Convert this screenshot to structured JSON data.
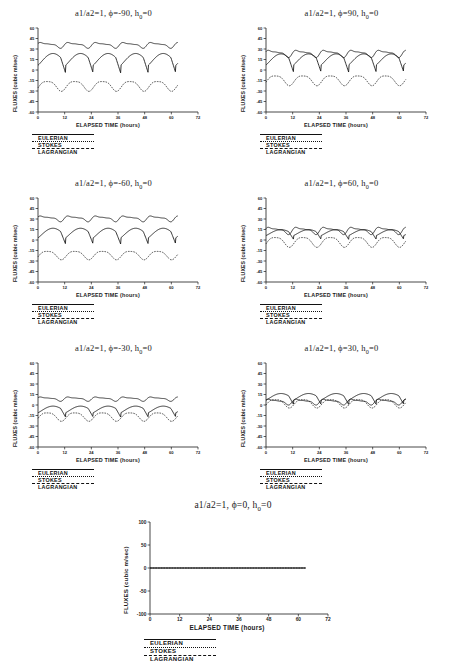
{
  "figure": {
    "axis_label_x": "ELAPSED TIME (hours)",
    "axis_label_y": "FLUXES (cubic m/sec)",
    "legend": [
      {
        "name": "EULERIAN",
        "style": "solid"
      },
      {
        "name": "STOKES",
        "style": "dotted"
      },
      {
        "name": "LAGRANGIAN",
        "style": "dashed"
      }
    ]
  },
  "chart_data": [
    {
      "type": "line",
      "title": "a1/a2=1, φ=-90, h₀=0",
      "title_parts": {
        "prefix": "a1/a2=1, ϕ=-90, h",
        "sub": "0",
        "suffix": "=0"
      },
      "xlabel": "ELAPSED TIME (hours)",
      "ylabel": "FLUXES (cubic m/sec)",
      "xlim": [
        0,
        72
      ],
      "ylim": [
        -60,
        60
      ],
      "xticks": [
        0,
        12,
        24,
        36,
        48,
        60,
        72
      ],
      "yticks": [
        60,
        45,
        30,
        15,
        0,
        -15,
        -30,
        -45,
        -60
      ],
      "grid": false,
      "series": [
        {
          "name": "STOKES",
          "style": "dotted",
          "mean": 36,
          "amp": 4,
          "shape": "wiggle",
          "period": 12.4
        },
        {
          "name": "EULERIAN",
          "style": "solid",
          "mean": 14,
          "amp": 16,
          "shape": "sawtooth",
          "period": 12.4
        },
        {
          "name": "LAGRANGIAN",
          "style": "dashed",
          "mean": -22,
          "amp": 7,
          "shape": "wave",
          "period": 12.4
        }
      ]
    },
    {
      "type": "line",
      "title": "a1/a2=1, φ=90, h₀=0",
      "title_parts": {
        "prefix": "a1/a2=1, ϕ=90, h",
        "sub": "0",
        "suffix": "=0"
      },
      "xlabel": "ELAPSED TIME (hours)",
      "ylabel": "FLUXES (cubic m/sec)",
      "xlim": [
        0,
        72
      ],
      "ylim": [
        -60,
        60
      ],
      "xticks": [
        0,
        12,
        24,
        36,
        48,
        60,
        72
      ],
      "yticks": [
        60,
        45,
        30,
        15,
        0,
        -15,
        -30,
        -45,
        -60
      ],
      "grid": false,
      "series": [
        {
          "name": "STOKES",
          "style": "dotted",
          "mean": 24,
          "amp": 5,
          "shape": "wiggle",
          "period": 12.4
        },
        {
          "name": "EULERIAN",
          "style": "solid",
          "mean": 14,
          "amp": 15,
          "shape": "sawtooth",
          "period": 12.4
        },
        {
          "name": "LAGRANGIAN",
          "style": "dashed",
          "mean": -14,
          "amp": 7,
          "shape": "wave",
          "period": 12.4
        }
      ]
    },
    {
      "type": "line",
      "title": "a1/a2=1, φ=-60, h₀=0",
      "title_parts": {
        "prefix": "a1/a2=1, ϕ=-60, h",
        "sub": "0",
        "suffix": "=0"
      },
      "xlabel": "ELAPSED TIME (hours)",
      "ylabel": "FLUXES (cubic m/sec)",
      "xlim": [
        0,
        72
      ],
      "ylim": [
        -60,
        60
      ],
      "xticks": [
        0,
        12,
        24,
        36,
        48,
        60,
        72
      ],
      "yticks": [
        60,
        45,
        30,
        15,
        0,
        -15,
        -30,
        -45,
        -60
      ],
      "grid": false,
      "series": [
        {
          "name": "STOKES",
          "style": "dotted",
          "mean": 31,
          "amp": 4,
          "shape": "wiggle",
          "period": 12.4
        },
        {
          "name": "EULERIAN",
          "style": "solid",
          "mean": 9,
          "amp": 13,
          "shape": "sawtooth",
          "period": 12.4
        },
        {
          "name": "LAGRANGIAN",
          "style": "dashed",
          "mean": -21,
          "amp": 6,
          "shape": "wave",
          "period": 12.4
        }
      ]
    },
    {
      "type": "line",
      "title": "a1/a2=1, φ=60, h₀=0",
      "title_parts": {
        "prefix": "a1/a2=1, ϕ=60, h",
        "sub": "0",
        "suffix": "=0"
      },
      "xlabel": "ELAPSED TIME (hours)",
      "ylabel": "FLUXES (cubic m/sec)",
      "xlim": [
        0,
        72
      ],
      "ylim": [
        -60,
        60
      ],
      "xticks": [
        0,
        12,
        24,
        36,
        48,
        60,
        72
      ],
      "yticks": [
        60,
        45,
        30,
        15,
        0,
        -15,
        -30,
        -45,
        -60
      ],
      "grid": false,
      "series": [
        {
          "name": "STOKES",
          "style": "dotted",
          "mean": 14,
          "amp": 5,
          "shape": "wiggle",
          "period": 12.4
        },
        {
          "name": "EULERIAN",
          "style": "solid",
          "mean": 10,
          "amp": 8,
          "shape": "sawtooth",
          "period": 12.4
        },
        {
          "name": "LAGRANGIAN",
          "style": "dashed",
          "mean": -2,
          "amp": 7,
          "shape": "wave",
          "period": 12.4
        }
      ]
    },
    {
      "type": "line",
      "title": "a1/a2=1, φ=-30, h₀=0",
      "title_parts": {
        "prefix": "a1/a2=1, ϕ=-30, h",
        "sub": "0",
        "suffix": "=0"
      },
      "xlabel": "ELAPSED TIME (hours)",
      "ylabel": "FLUXES (cubic m/sec)",
      "xlim": [
        0,
        72
      ],
      "ylim": [
        -60,
        60
      ],
      "xticks": [
        0,
        12,
        24,
        36,
        48,
        60,
        72
      ],
      "yticks": [
        60,
        45,
        30,
        15,
        0,
        -15,
        -30,
        -45,
        -60
      ],
      "grid": false,
      "series": [
        {
          "name": "STOKES",
          "style": "dotted",
          "mean": 9,
          "amp": 3,
          "shape": "wiggle",
          "period": 12.4
        },
        {
          "name": "EULERIAN",
          "style": "solid",
          "mean": -7,
          "amp": 9,
          "shape": "sawtooth",
          "period": 12.4
        },
        {
          "name": "LAGRANGIAN",
          "style": "dashed",
          "mean": -16,
          "amp": 6,
          "shape": "wave",
          "period": 12.4
        }
      ]
    },
    {
      "type": "line",
      "title": "a1/a2=1, φ=30, h₀=0",
      "title_parts": {
        "prefix": "a1/a2=1, ϕ=30, h",
        "sub": "0",
        "suffix": "=0"
      },
      "xlabel": "ELAPSED TIME (hours)",
      "ylabel": "FLUXES (cubic m/sec)",
      "xlim": [
        0,
        72
      ],
      "ylim": [
        -60,
        60
      ],
      "xticks": [
        0,
        12,
        24,
        36,
        48,
        60,
        72
      ],
      "yticks": [
        60,
        45,
        30,
        15,
        0,
        -15,
        -30,
        -45,
        -60
      ],
      "grid": false,
      "series": [
        {
          "name": "STOKES",
          "style": "dotted",
          "mean": 5,
          "amp": 4,
          "shape": "wiggle",
          "period": 12.4
        },
        {
          "name": "EULERIAN",
          "style": "solid",
          "mean": 11,
          "amp": 9,
          "shape": "sawtooth",
          "period": 12.4
        },
        {
          "name": "LAGRANGIAN",
          "style": "dashed",
          "mean": 3,
          "amp": 6,
          "shape": "wave",
          "period": 12.4
        }
      ]
    },
    {
      "type": "line",
      "title": "a1/a2=1, φ=0, h₀=0",
      "title_parts": {
        "prefix": "a1/a2=1, ϕ=0, h",
        "sub": "0",
        "suffix": "=0"
      },
      "xlabel": "ELAPSED TIME (hours)",
      "ylabel": "FLUXES (cubic m/sec)",
      "xlim": [
        0,
        72
      ],
      "ylim": [
        -100,
        100
      ],
      "xticks": [
        0,
        12,
        24,
        36,
        48,
        60,
        72
      ],
      "yticks": [
        100,
        50,
        0,
        -50,
        -100
      ],
      "grid": false,
      "series": [
        {
          "name": "STOKES",
          "style": "dotted",
          "mean": 0,
          "amp": 0,
          "shape": "flat",
          "period": 12.4
        },
        {
          "name": "EULERIAN",
          "style": "solid",
          "mean": 0,
          "amp": 0,
          "shape": "flat",
          "period": 12.4
        },
        {
          "name": "LAGRANGIAN",
          "style": "dashed",
          "mean": 0,
          "amp": 0,
          "shape": "flat",
          "period": 12.4
        }
      ]
    }
  ]
}
